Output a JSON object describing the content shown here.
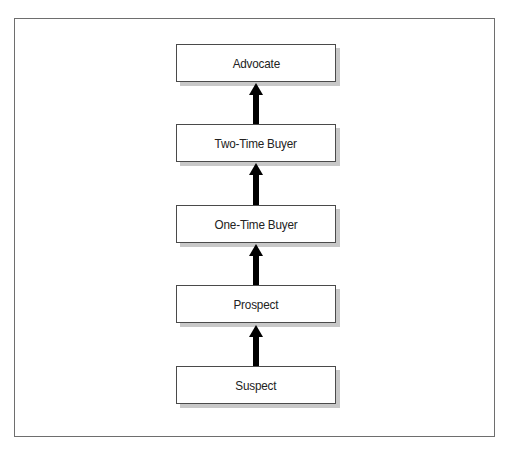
{
  "diagram": {
    "type": "flowchart-vertical",
    "direction": "bottom-to-top",
    "nodes": [
      {
        "id": "advocate",
        "label": "Advocate"
      },
      {
        "id": "two-time-buyer",
        "label": "Two-Time Buyer"
      },
      {
        "id": "one-time-buyer",
        "label": "One-Time Buyer"
      },
      {
        "id": "prospect",
        "label": "Prospect"
      },
      {
        "id": "suspect",
        "label": "Suspect"
      }
    ],
    "edges": [
      {
        "from": "suspect",
        "to": "prospect"
      },
      {
        "from": "prospect",
        "to": "one-time-buyer"
      },
      {
        "from": "one-time-buyer",
        "to": "two-time-buyer"
      },
      {
        "from": "two-time-buyer",
        "to": "advocate"
      }
    ]
  },
  "colors": {
    "frame_border": "#6e6e6e",
    "node_border": "#4a4a4a",
    "node_shadow": "#c8c8c8",
    "arrow": "#000000",
    "text": "#222222",
    "background": "#ffffff"
  }
}
